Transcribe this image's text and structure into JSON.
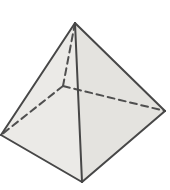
{
  "figure": {
    "canvas": {
      "width": 170,
      "height": 190,
      "background": "#ffffff"
    },
    "colors": {
      "face_left": "#ebeae7",
      "face_right": "#e4e3df",
      "edge": "#474747",
      "hidden_edge": "#4f4f4f"
    },
    "stroke": {
      "width": 2,
      "hidden_width": 2,
      "dash_pattern": "7 4.5"
    },
    "vertices": {
      "apex": [
        75,
        23
      ],
      "left": [
        1,
        135
      ],
      "front": [
        82,
        182
      ],
      "right": [
        165,
        111
      ],
      "back": [
        63,
        86
      ]
    },
    "faces": [
      {
        "name": "pyramid-left-face",
        "points": [
          "apex",
          "left",
          "front"
        ],
        "fill": "face_left"
      },
      {
        "name": "pyramid-right-face",
        "points": [
          "apex",
          "front",
          "right"
        ],
        "fill": "face_right"
      }
    ],
    "solid_edges": [
      {
        "name": "edge-apex-left",
        "from": "apex",
        "to": "left"
      },
      {
        "name": "edge-apex-right",
        "from": "apex",
        "to": "right"
      },
      {
        "name": "edge-apex-front",
        "from": "apex",
        "to": "front"
      },
      {
        "name": "edge-left-front",
        "from": "left",
        "to": "front"
      },
      {
        "name": "edge-front-right",
        "from": "front",
        "to": "right"
      }
    ],
    "hidden_edges": [
      {
        "name": "hidden-edge-apex-back",
        "from": "apex",
        "to": "back"
      },
      {
        "name": "hidden-edge-back-left",
        "from": "back",
        "to": "left"
      },
      {
        "name": "hidden-edge-back-right",
        "from": "back",
        "to": "right"
      }
    ]
  }
}
